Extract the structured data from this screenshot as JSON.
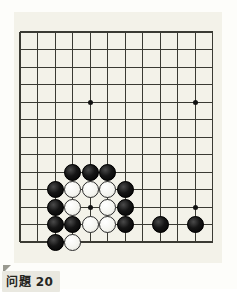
{
  "page": {
    "background_color": "#fdfdfa",
    "width": 237,
    "height": 289
  },
  "board": {
    "name": "go-board",
    "background_color": "#f3f2e9",
    "line_color": "#3a3a33",
    "border_line_width": 1.6,
    "inner_line_width": 1.0,
    "origin_x": 6,
    "origin_y": 20,
    "cell_size": 17.5,
    "columns": 12,
    "rows": 13,
    "star_point_color": "#111111",
    "star_points": [
      {
        "col": 4,
        "row": 4
      },
      {
        "col": 10,
        "row": 4
      },
      {
        "col": 4,
        "row": 10
      },
      {
        "col": 10,
        "row": 10
      }
    ],
    "stone_diameter": 17,
    "stone_colors": {
      "black": "#0d0d0d",
      "white": "#fcfcfa"
    },
    "stones": [
      {
        "color": "black",
        "col": 3,
        "row": 8
      },
      {
        "color": "black",
        "col": 4,
        "row": 8
      },
      {
        "color": "black",
        "col": 5,
        "row": 8
      },
      {
        "color": "black",
        "col": 2,
        "row": 9
      },
      {
        "color": "white",
        "col": 3,
        "row": 9
      },
      {
        "color": "white",
        "col": 4,
        "row": 9
      },
      {
        "color": "white",
        "col": 5,
        "row": 9
      },
      {
        "color": "black",
        "col": 6,
        "row": 9
      },
      {
        "color": "black",
        "col": 2,
        "row": 10
      },
      {
        "color": "white",
        "col": 3,
        "row": 10
      },
      {
        "color": "white",
        "col": 5,
        "row": 10
      },
      {
        "color": "black",
        "col": 6,
        "row": 10
      },
      {
        "color": "black",
        "col": 2,
        "row": 11
      },
      {
        "color": "black",
        "col": 3,
        "row": 11
      },
      {
        "color": "white",
        "col": 4,
        "row": 11
      },
      {
        "color": "white",
        "col": 5,
        "row": 11
      },
      {
        "color": "black",
        "col": 6,
        "row": 11
      },
      {
        "color": "black",
        "col": 8,
        "row": 11
      },
      {
        "color": "black",
        "col": 10,
        "row": 11
      },
      {
        "color": "black",
        "col": 2,
        "row": 12
      },
      {
        "color": "white",
        "col": 3,
        "row": 12
      }
    ]
  },
  "caption": {
    "label": "问題 20",
    "background_color": "#e9e8e0",
    "text_color": "#26261f",
    "fold_color": "#9a9a90"
  }
}
